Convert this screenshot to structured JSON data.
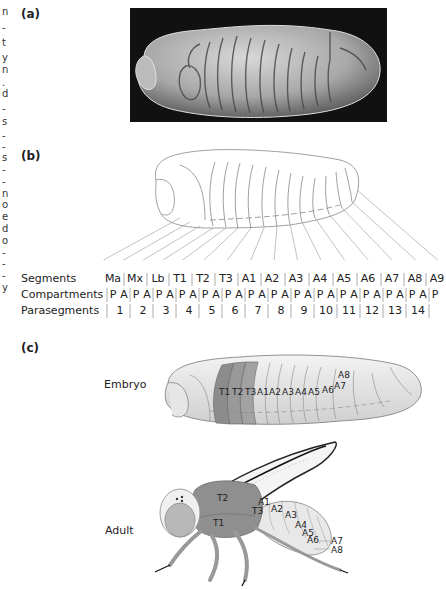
{
  "margin_fragments": [
    "n",
    "-",
    "t",
    "y",
    "n",
    ".",
    "d",
    "-",
    "s",
    "-",
    "-",
    "s",
    "-",
    "-",
    "n",
    "o",
    "e",
    "d",
    "o",
    "-",
    "-",
    "-",
    "y"
  ],
  "panels": {
    "a": {
      "label": "(a)",
      "content": "scanning electron micrograph of embryo"
    },
    "b": {
      "label": "(b)",
      "rows": {
        "segments_label": "Segments",
        "compartments_label": "Compartments",
        "parasegments_label": "Parasegments"
      },
      "segments": [
        "Ma",
        "Mx",
        "Lb",
        "T1",
        "T2",
        "T3",
        "A1",
        "A2",
        "A3",
        "A4",
        "A5",
        "A6",
        "A7",
        "A8",
        "A9"
      ],
      "compartments": [
        "P",
        "A",
        "P",
        "A",
        "P",
        "A",
        "P",
        "A",
        "P",
        "A",
        "P",
        "A",
        "P",
        "A",
        "P",
        "A",
        "P",
        "A",
        "P",
        "A",
        "P",
        "A",
        "P",
        "A",
        "P",
        "A",
        "P",
        "A",
        "P"
      ],
      "parasegments": [
        "1",
        "2",
        "3",
        "4",
        "5",
        "6",
        "7",
        "8",
        "9",
        "10",
        "11",
        "12",
        "13",
        "14"
      ]
    },
    "c": {
      "label": "(c)",
      "embryo": {
        "caption": "Embryo",
        "segment_labels": [
          "T1",
          "T2",
          "T3",
          "A1",
          "A2",
          "A3",
          "A4",
          "A5",
          "A6",
          "A7",
          "A8"
        ]
      },
      "adult": {
        "caption": "Adult",
        "segment_labels": [
          "T2",
          "T1",
          "T3",
          "A1",
          "A2",
          "A3",
          "A4",
          "A5",
          "A6",
          "A7",
          "A8"
        ]
      }
    }
  },
  "colors": {
    "thorax_dark": "#8a8a8a",
    "body_light": "#e2e2e2",
    "outline": "#777777",
    "photo_bg": "#111111"
  }
}
